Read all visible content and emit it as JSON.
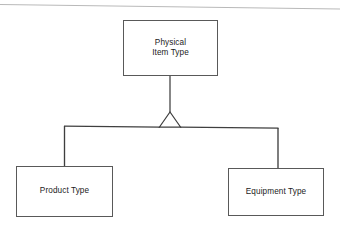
{
  "diagram": {
    "type": "uml-generalization-hierarchy",
    "title": "",
    "colors": {
      "background": "#ffffff",
      "stroke": "#4a4a4a",
      "text": "#1b1b1b"
    },
    "nodes": [
      {
        "id": "physical-item-type",
        "label": "Physical\nItem Type",
        "role": "superclass",
        "x": 123,
        "y": 20,
        "width": 95,
        "height": 56
      },
      {
        "id": "product-type",
        "label": "Product Type",
        "role": "subclass",
        "x": 16,
        "y": 166,
        "width": 97,
        "height": 51
      },
      {
        "id": "equipment-type",
        "label": "Equipment Type",
        "role": "subclass",
        "x": 228,
        "y": 168,
        "width": 96,
        "height": 48
      }
    ],
    "connectors": [
      {
        "id": "generalization-trunk",
        "from": "physical-item-type",
        "to": "junction",
        "kind": "generalization"
      },
      {
        "id": "generalization-product-type",
        "from": "junction",
        "to": "product-type",
        "kind": "generalization"
      },
      {
        "id": "generalization-equipment-type",
        "from": "junction",
        "to": "equipment-type",
        "kind": "generalization"
      }
    ],
    "arrowhead": {
      "id": "generalization-triangle",
      "shape": "hollow-triangle",
      "apex_x": 170,
      "apex_y": 113,
      "base_y": 127,
      "half_width": 10
    },
    "page_rule": {
      "id": "top-scan-rule",
      "x1": 0,
      "y1": 4,
      "x2": 340,
      "y2": 9
    }
  }
}
